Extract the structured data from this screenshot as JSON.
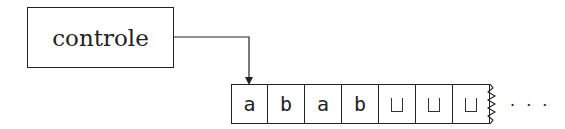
{
  "control": {
    "label": "controle"
  },
  "tape": {
    "cells": [
      {
        "symbol": "a",
        "blank": false
      },
      {
        "symbol": "b",
        "blank": false
      },
      {
        "symbol": "a",
        "blank": false
      },
      {
        "symbol": "b",
        "blank": false
      },
      {
        "symbol": "",
        "blank": true
      },
      {
        "symbol": "",
        "blank": true
      },
      {
        "symbol": "",
        "blank": true
      }
    ],
    "continuation": "· · ·"
  },
  "head_position": 0
}
